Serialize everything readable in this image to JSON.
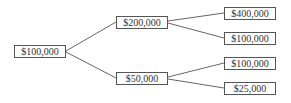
{
  "diagram": {
    "type": "tree",
    "root": {
      "id": "n0",
      "label": "$100,000",
      "children": [
        {
          "id": "n1",
          "label": "$200,000",
          "children": [
            {
              "id": "n3",
              "label": "$400,000",
              "children": []
            },
            {
              "id": "n4",
              "label": "$100,000",
              "children": []
            }
          ]
        },
        {
          "id": "n2",
          "label": "$50,000",
          "children": [
            {
              "id": "n5",
              "label": "$100,000",
              "children": []
            },
            {
              "id": "n6",
              "label": "$25,000",
              "children": []
            }
          ]
        }
      ]
    },
    "colors": {
      "line": "#666666",
      "border": "#555555",
      "text": "#333333"
    }
  }
}
